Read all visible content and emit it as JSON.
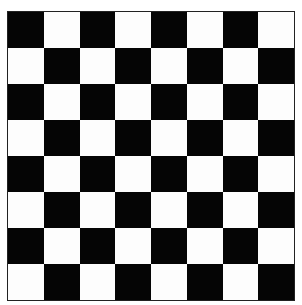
{
  "board": {
    "rows": 8,
    "cols": 8,
    "top_left": "dark",
    "colors": {
      "dark": "#050505",
      "light": "#fdfdfd"
    }
  }
}
